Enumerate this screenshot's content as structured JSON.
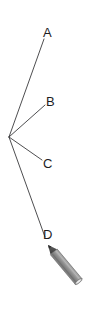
{
  "figure": {
    "kind": "ray-diagram-with-pencil",
    "background_color": "#ffffff",
    "line_color": "#3a3a3c",
    "label_color": "#1d1d1f",
    "width": 85,
    "height": 313
  },
  "vertex": {
    "name": "ray-origin",
    "x": 9,
    "y": 137
  },
  "rays": [
    {
      "label": "A",
      "from_x": 9,
      "from_y": 137,
      "to_x": 44,
      "to_y": 39,
      "label_x": 43,
      "label_y": 26
    },
    {
      "label": "B",
      "from_x": 9,
      "from_y": 137,
      "to_x": 45,
      "to_y": 105,
      "label_x": 46,
      "label_y": 95
    },
    {
      "label": "C",
      "from_x": 9,
      "from_y": 137,
      "to_x": 42,
      "to_y": 160,
      "label_x": 43,
      "label_y": 157
    },
    {
      "label": "D",
      "from_x": 9,
      "from_y": 137,
      "to_x": 45,
      "to_y": 237,
      "label_x": 43,
      "label_y": 228
    }
  ],
  "pencil": {
    "name": "pencil-illustration",
    "body_color": "#8e8e8e",
    "body_highlight": "#a8a8a8",
    "body_shadow": "#6f6f6f",
    "tip_color": "#4a4a4a",
    "end_inner_color": "#cfcfcf",
    "outline_color": "#5a5a5a",
    "tip_x": 48,
    "tip_y": 245,
    "end_x": 79,
    "end_y": 282
  },
  "labels": {
    "a": "A",
    "b": "B",
    "c": "C",
    "d": "D"
  }
}
